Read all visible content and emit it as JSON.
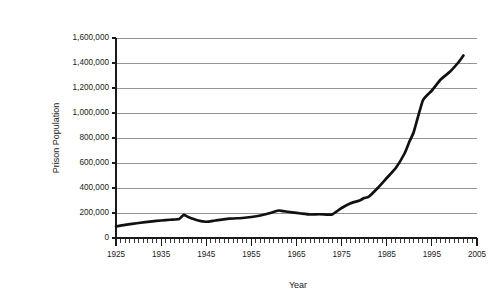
{
  "chart_data": {
    "type": "line",
    "title": "",
    "xlabel": "Year",
    "ylabel": "Prison Population",
    "xlim": [
      1925,
      2005
    ],
    "ylim": [
      0,
      1600000
    ],
    "grid": "horizontal",
    "legend": "none",
    "x_tick_labels": [
      "1925",
      "1935",
      "1945",
      "1955",
      "1965",
      "1975",
      "1985",
      "1995",
      "2005"
    ],
    "x_tick_values": [
      1925,
      1935,
      1945,
      1955,
      1965,
      1975,
      1985,
      1995,
      2005
    ],
    "x_minor_tick_interval": 1,
    "y_tick_labels": [
      "0",
      "200,000",
      "400,000",
      "600,000",
      "800,000",
      "1,000,000",
      "1,200,000",
      "1,400,000",
      "1,600,000"
    ],
    "y_tick_values": [
      0,
      200000,
      400000,
      600000,
      800000,
      1000000,
      1200000,
      1400000,
      1600000
    ],
    "series": [
      {
        "name": "Prison Population",
        "color": "#111111",
        "x": [
          1925,
          1927,
          1930,
          1933,
          1935,
          1937,
          1939,
          1940,
          1941,
          1943,
          1945,
          1947,
          1950,
          1953,
          1955,
          1957,
          1959,
          1961,
          1962,
          1964,
          1966,
          1968,
          1970,
          1972,
          1973,
          1975,
          1977,
          1979,
          1980,
          1981,
          1983,
          1985,
          1987,
          1989,
          1990,
          1991,
          1993,
          1995,
          1997,
          1999,
          2001,
          2002
        ],
        "values": [
          92000,
          105000,
          120000,
          133000,
          140000,
          146000,
          152000,
          185000,
          168000,
          142000,
          130000,
          140000,
          155000,
          160000,
          168000,
          180000,
          198000,
          220000,
          215000,
          205000,
          196000,
          188000,
          190000,
          187000,
          190000,
          240000,
          278000,
          300000,
          320000,
          330000,
          400000,
          480000,
          560000,
          680000,
          770000,
          850000,
          1100000,
          1180000,
          1270000,
          1330000,
          1410000,
          1460000
        ]
      }
    ]
  },
  "labels": {
    "x_axis_title": "Year",
    "y_axis_title": "Prison Population"
  }
}
